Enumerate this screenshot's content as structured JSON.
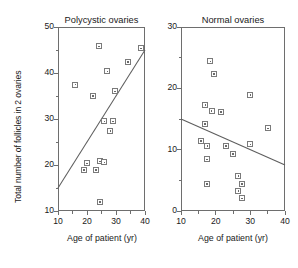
{
  "figure": {
    "background": "#ffffff",
    "marker_color": "#7a7a7a",
    "axis_color": "#6e6e6e",
    "line_color": "#5d5d5d",
    "shared_ylabel": "Total number of follicles in 2 ovaries",
    "shared_xlabel": "Age of patient (yr)"
  },
  "chart_data": [
    {
      "type": "scatter",
      "title": "Polycystic ovaries",
      "xlabel": "Age of patient (yr)",
      "ylabel": "Total number of follicles in 2 ovaries",
      "xlim": [
        10,
        40
      ],
      "ylim": [
        10,
        50
      ],
      "xticks": [
        10,
        20,
        30,
        40
      ],
      "xticklabels": [
        "10",
        "20",
        "30",
        "40"
      ],
      "xminorticks": [
        15,
        25,
        35
      ],
      "yticks": [
        10,
        20,
        30,
        40,
        50
      ],
      "yticklabels": [
        "10",
        "20",
        "30",
        "40",
        "50"
      ],
      "yminorticks": [
        15,
        25,
        35,
        45
      ],
      "grid": false,
      "legend": "none",
      "points": [
        {
          "x": 16.0,
          "y": 37.5
        },
        {
          "x": 24.0,
          "y": 45.8
        },
        {
          "x": 22.0,
          "y": 35.0
        },
        {
          "x": 27.0,
          "y": 40.4
        },
        {
          "x": 29.5,
          "y": 36.0
        },
        {
          "x": 34.0,
          "y": 42.4
        },
        {
          "x": 38.5,
          "y": 45.4
        },
        {
          "x": 26.0,
          "y": 29.5
        },
        {
          "x": 29.0,
          "y": 29.5
        },
        {
          "x": 28.0,
          "y": 27.4
        },
        {
          "x": 20.0,
          "y": 20.4
        },
        {
          "x": 19.0,
          "y": 19.0
        },
        {
          "x": 24.5,
          "y": 20.8
        },
        {
          "x": 26.0,
          "y": 20.6
        },
        {
          "x": 23.0,
          "y": 19.0
        },
        {
          "x": 24.5,
          "y": 12.0
        }
      ],
      "fit_line": {
        "x0": 10,
        "y0": 15.0,
        "x1": 40,
        "y1": 45.0,
        "trend": "positive"
      }
    },
    {
      "type": "scatter",
      "title": "Normal ovaries",
      "xlabel": "Age of patient (yr)",
      "ylabel": "",
      "xlim": [
        10,
        40
      ],
      "ylim": [
        0,
        30
      ],
      "xticks": [
        10,
        20,
        30,
        40
      ],
      "xticklabels": [
        "10",
        "20",
        "30",
        "40"
      ],
      "xminorticks": [
        15,
        25,
        35
      ],
      "yticks": [
        0,
        10,
        20,
        30
      ],
      "yticklabels": [
        "0",
        "10",
        "20",
        "30"
      ],
      "yminorticks": [
        5,
        15,
        25
      ],
      "grid": false,
      "legend": "none",
      "points": [
        {
          "x": 18.5,
          "y": 24.4
        },
        {
          "x": 19.5,
          "y": 22.4
        },
        {
          "x": 17.0,
          "y": 17.3
        },
        {
          "x": 21.5,
          "y": 16.2
        },
        {
          "x": 30.0,
          "y": 18.9
        },
        {
          "x": 16.8,
          "y": 14.2
        },
        {
          "x": 18.8,
          "y": 16.3
        },
        {
          "x": 35.0,
          "y": 13.5
        },
        {
          "x": 15.8,
          "y": 11.4
        },
        {
          "x": 17.6,
          "y": 10.6
        },
        {
          "x": 23.0,
          "y": 10.6
        },
        {
          "x": 30.0,
          "y": 10.9
        },
        {
          "x": 25.0,
          "y": 9.3
        },
        {
          "x": 17.5,
          "y": 8.4
        },
        {
          "x": 26.5,
          "y": 5.7
        },
        {
          "x": 17.5,
          "y": 4.4
        },
        {
          "x": 27.5,
          "y": 4.4
        },
        {
          "x": 26.5,
          "y": 3.3
        },
        {
          "x": 27.5,
          "y": 2.1
        }
      ],
      "fit_line": {
        "x0": 10,
        "y0": 15.0,
        "x1": 40,
        "y1": 7.5,
        "trend": "negative"
      }
    }
  ]
}
